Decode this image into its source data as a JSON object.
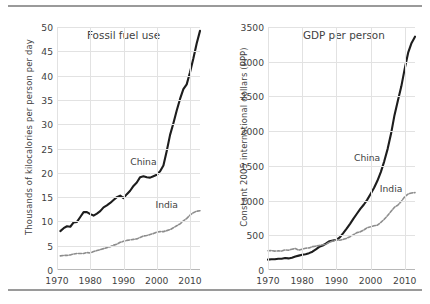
{
  "figure": {
    "rules": {
      "top": "divider-top",
      "bottom": "divider-bottom"
    },
    "divider_color": "#9a9a9a",
    "background": "#ffffff"
  },
  "chart_data": [
    {
      "type": "line",
      "panel": "left",
      "title": "Fossil fuel use",
      "xlabel": "",
      "ylabel": "Thousands of kilocalories per person per day",
      "xlim": [
        1970,
        2013
      ],
      "ylim": [
        0,
        50
      ],
      "grid": true,
      "legend_position": "inline-annotation",
      "yticks": [
        0,
        5,
        10,
        15,
        20,
        25,
        30,
        35,
        40,
        45,
        50
      ],
      "ytick_labels": [
        "0",
        "5",
        "10",
        "15",
        "20",
        "25",
        "30",
        "35",
        "40",
        "45",
        "50"
      ],
      "xticks": [
        1970,
        1980,
        1990,
        2000,
        2010
      ],
      "xtick_labels": [
        "1970",
        "1980",
        "1990",
        "2000",
        "2010"
      ],
      "x": [
        1971,
        1972,
        1973,
        1974,
        1975,
        1976,
        1977,
        1978,
        1979,
        1980,
        1981,
        1982,
        1983,
        1984,
        1985,
        1986,
        1987,
        1988,
        1989,
        1990,
        1991,
        1992,
        1993,
        1994,
        1995,
        1996,
        1997,
        1998,
        1999,
        2000,
        2001,
        2002,
        2003,
        2004,
        2005,
        2006,
        2007,
        2008,
        2009,
        2010,
        2011,
        2012,
        2013
      ],
      "series": [
        {
          "name": "China",
          "color": "#1d1d1d",
          "style": "solid",
          "values": [
            8.0,
            8.6,
            9.0,
            8.9,
            9.8,
            9.9,
            10.9,
            11.9,
            11.9,
            11.5,
            11.2,
            11.6,
            12.1,
            12.9,
            13.3,
            13.8,
            14.4,
            15.0,
            15.3,
            14.8,
            15.6,
            16.3,
            17.3,
            18.0,
            19.1,
            19.3,
            19.1,
            19.0,
            19.3,
            19.6,
            20.3,
            21.5,
            24.5,
            27.8,
            30.2,
            32.8,
            35.2,
            37.2,
            38.2,
            40.7,
            43.5,
            46.6,
            49.2
          ]
        },
        {
          "name": "India",
          "color": "#8d8d8d",
          "style": "dashed",
          "values": [
            2.9,
            3.0,
            3.0,
            3.1,
            3.3,
            3.4,
            3.4,
            3.4,
            3.6,
            3.5,
            3.8,
            4.0,
            4.2,
            4.4,
            4.6,
            4.8,
            5.1,
            5.3,
            5.7,
            5.9,
            6.1,
            6.2,
            6.3,
            6.4,
            6.7,
            7.0,
            7.1,
            7.3,
            7.5,
            7.8,
            7.9,
            7.9,
            8.1,
            8.3,
            8.7,
            9.1,
            9.5,
            10.1,
            10.6,
            11.3,
            11.8,
            12.1,
            12.2
          ]
        }
      ],
      "annotations": [
        {
          "text": "China",
          "x": 1996,
          "y": 22.2
        },
        {
          "text": "India",
          "x": 2003,
          "y": 13.3
        }
      ]
    },
    {
      "type": "line",
      "panel": "right",
      "title": "GDP per person",
      "xlabel": "",
      "ylabel": "Constant 2005 international dollars (PPP)",
      "xlim": [
        1970,
        2013
      ],
      "ylim": [
        0,
        3500
      ],
      "grid": true,
      "legend_position": "inline-annotation",
      "yticks": [
        0,
        500,
        1000,
        1500,
        2000,
        2500,
        3000,
        3500
      ],
      "ytick_labels": [
        "0",
        "500",
        "1000",
        "1500",
        "2000",
        "2500",
        "3000",
        "3500"
      ],
      "xticks": [
        1970,
        1980,
        1990,
        2000,
        2010
      ],
      "xtick_labels": [
        "1970",
        "1980",
        "1990",
        "2000",
        "2010"
      ],
      "x": [
        1970,
        1971,
        1972,
        1973,
        1974,
        1975,
        1976,
        1977,
        1978,
        1979,
        1980,
        1981,
        1982,
        1983,
        1984,
        1985,
        1986,
        1987,
        1988,
        1989,
        1990,
        1991,
        1992,
        1993,
        1994,
        1995,
        1996,
        1997,
        1998,
        1999,
        2000,
        2001,
        2002,
        2003,
        2004,
        2005,
        2006,
        2007,
        2008,
        2009,
        2010,
        2011,
        2012,
        2013
      ],
      "series": [
        {
          "name": "China",
          "color": "#1d1d1d",
          "style": "solid",
          "values": [
            150,
            155,
            155,
            163,
            162,
            172,
            167,
            177,
            195,
            207,
            220,
            228,
            243,
            264,
            296,
            333,
            353,
            382,
            415,
            426,
            435,
            470,
            530,
            595,
            665,
            740,
            810,
            880,
            940,
            1010,
            1095,
            1180,
            1285,
            1410,
            1565,
            1745,
            1965,
            2230,
            2440,
            2645,
            2900,
            3130,
            3270,
            3360
          ]
        },
        {
          "name": "India",
          "color": "#8d8d8d",
          "style": "dashed",
          "values": [
            278,
            280,
            272,
            276,
            272,
            290,
            285,
            300,
            310,
            285,
            300,
            313,
            318,
            336,
            344,
            354,
            363,
            372,
            400,
            418,
            436,
            428,
            441,
            457,
            480,
            508,
            538,
            550,
            575,
            610,
            622,
            636,
            646,
            686,
            730,
            785,
            845,
            905,
            935,
            990,
            1055,
            1095,
            1110,
            1115
          ]
        }
      ],
      "annotations": [
        {
          "text": "China",
          "x": 1999,
          "y": 1620
        },
        {
          "text": "India",
          "x": 2006,
          "y": 1165
        }
      ]
    }
  ]
}
